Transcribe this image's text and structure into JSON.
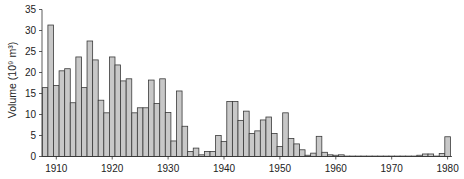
{
  "chart_data": {
    "type": "bar",
    "title": "",
    "xlabel": "",
    "ylabel": "Volume (10⁹ m³)",
    "ylim": [
      0,
      35
    ],
    "yticks": [
      0,
      5,
      10,
      15,
      20,
      25,
      30,
      35
    ],
    "xticks": [
      1910,
      1920,
      1930,
      1940,
      1950,
      1960,
      1970,
      1980
    ],
    "grid": false,
    "legend": null,
    "bar_fill": "#c8c8c8",
    "bar_stroke": "#3a3a3a",
    "categories": [
      1908,
      1909,
      1910,
      1911,
      1912,
      1913,
      1914,
      1915,
      1916,
      1917,
      1918,
      1919,
      1920,
      1921,
      1922,
      1923,
      1924,
      1925,
      1926,
      1927,
      1928,
      1929,
      1930,
      1931,
      1932,
      1933,
      1934,
      1935,
      1936,
      1937,
      1938,
      1939,
      1940,
      1941,
      1942,
      1943,
      1944,
      1945,
      1946,
      1947,
      1948,
      1949,
      1950,
      1951,
      1952,
      1953,
      1954,
      1955,
      1956,
      1957,
      1958,
      1959,
      1960,
      1961,
      1962,
      1963,
      1964,
      1965,
      1966,
      1967,
      1968,
      1969,
      1970,
      1971,
      1972,
      1973,
      1974,
      1975,
      1976,
      1977,
      1978,
      1979,
      1980
    ],
    "values": [
      16.4,
      31.3,
      16.9,
      20.4,
      20.9,
      12.8,
      23.7,
      16.4,
      27.5,
      23.0,
      13.4,
      10.4,
      23.7,
      21.8,
      18.0,
      18.5,
      10.4,
      11.6,
      11.6,
      18.2,
      12.6,
      18.5,
      10.5,
      3.7,
      15.6,
      7.2,
      1.2,
      2.0,
      0.4,
      1.2,
      1.2,
      5.0,
      3.6,
      13.1,
      13.1,
      8.6,
      10.8,
      5.5,
      6.1,
      8.7,
      9.4,
      5.5,
      2.4,
      10.4,
      4.3,
      3.0,
      1.6,
      0.3,
      0.8,
      4.8,
      1.0,
      0.4,
      0.3,
      0.4,
      0.1,
      0.1,
      0.1,
      0.1,
      0.1,
      0.1,
      0.1,
      0.1,
      0.1,
      0.1,
      0.1,
      0.1,
      0.1,
      0.3,
      0.6,
      0.6,
      0.1,
      0.7,
      4.7
    ]
  }
}
